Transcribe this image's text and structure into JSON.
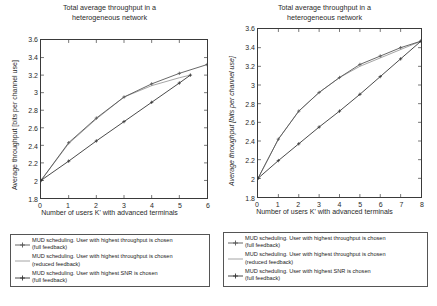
{
  "figure": {
    "title_line1": "Total average throughput in a",
    "title_line2": "heterogeneous network",
    "xlabel": "Number of users K' with advanced terminals",
    "ylabel": "Average throughput [bits per channel use]"
  },
  "legend": {
    "entries": [
      {
        "line1": "MUD scheduling. User with highest throughput is chosen",
        "line2": "(full feedback)",
        "marker": "plus-marker-line",
        "color": "#555555"
      },
      {
        "line1": "MUD scheduling. User with highest throughput is chosen",
        "line2": "(reduced feedback)",
        "marker": "plain-line",
        "color": "#9a9a9a"
      },
      {
        "line1": "MUD scheduling. User with highest SNR is chosen",
        "line2": "(full feedback)",
        "marker": "plus-marker-line",
        "color": "#333333"
      }
    ]
  },
  "chart_data": [
    {
      "id": "left-chart",
      "type": "line",
      "title": "Total average throughput in a heterogeneous network",
      "xlabel": "Number of users K' with advanced terminals",
      "ylabel": "Average throughput [bits per channel use]",
      "xlim": [
        0,
        6
      ],
      "ylim": [
        1.8,
        3.6
      ],
      "xticks": [
        0,
        1,
        2,
        3,
        4,
        5,
        6
      ],
      "yticks": [
        1.8,
        2,
        2.2,
        2.4,
        2.6,
        2.8,
        3,
        3.2,
        3.4,
        3.6
      ],
      "grid": false,
      "legend_position": "below-figure",
      "series": [
        {
          "name": "MUD scheduling. User with highest throughput is chosen (full feedback)",
          "color": "#555555",
          "marker": "plus",
          "x": [
            0,
            1,
            2,
            3,
            4,
            5,
            6
          ],
          "y": [
            2.0,
            2.43,
            2.71,
            2.95,
            3.1,
            3.22,
            3.32
          ]
        },
        {
          "name": "MUD scheduling. User with highest throughput is chosen (reduced feedback)",
          "color": "#9a9a9a",
          "marker": "none",
          "x": [
            0,
            1,
            2,
            3,
            4,
            5,
            5.4
          ],
          "y": [
            2.0,
            2.42,
            2.7,
            2.95,
            3.08,
            3.17,
            3.2
          ]
        },
        {
          "name": "MUD scheduling. User with highest SNR is chosen (full feedback)",
          "color": "#333333",
          "marker": "plus",
          "x": [
            0,
            1,
            2,
            3,
            4,
            5,
            5.4
          ],
          "y": [
            2.0,
            2.22,
            2.45,
            2.67,
            2.89,
            3.11,
            3.2
          ]
        }
      ]
    },
    {
      "id": "right-chart",
      "type": "line",
      "title": "Total average throughput in a heterogeneous network",
      "xlabel": "Number of users K' with advanced terminals",
      "ylabel": "Average throughput [bits per channel use]",
      "xlim": [
        0,
        8
      ],
      "ylim": [
        1.8,
        3.6
      ],
      "xticks": [
        0,
        1,
        2,
        3,
        4,
        5,
        6,
        7,
        8
      ],
      "yticks": [
        1.8,
        2,
        2.2,
        2.4,
        2.6,
        2.8,
        3,
        3.2,
        3.4,
        3.6
      ],
      "grid": false,
      "legend_position": "below-figure",
      "series": [
        {
          "name": "MUD scheduling. User with highest throughput is chosen (full feedback)",
          "color": "#555555",
          "marker": "plus",
          "x": [
            0,
            1,
            2,
            3,
            4,
            5,
            6,
            7,
            8
          ],
          "y": [
            2.0,
            2.42,
            2.72,
            2.92,
            3.08,
            3.22,
            3.31,
            3.4,
            3.47
          ]
        },
        {
          "name": "MUD scheduling. User with highest throughput is chosen (reduced feedback)",
          "color": "#9a9a9a",
          "marker": "none",
          "x": [
            0,
            1,
            2,
            3,
            4,
            5,
            6,
            7,
            8
          ],
          "y": [
            2.0,
            2.42,
            2.72,
            2.92,
            3.08,
            3.2,
            3.29,
            3.38,
            3.47
          ]
        },
        {
          "name": "MUD scheduling. User with highest SNR is chosen (full feedback)",
          "color": "#333333",
          "marker": "plus",
          "x": [
            0,
            1,
            2,
            3,
            4,
            5,
            6,
            7,
            8
          ],
          "y": [
            2.0,
            2.19,
            2.37,
            2.55,
            2.72,
            2.9,
            3.09,
            3.28,
            3.47
          ]
        }
      ]
    }
  ]
}
